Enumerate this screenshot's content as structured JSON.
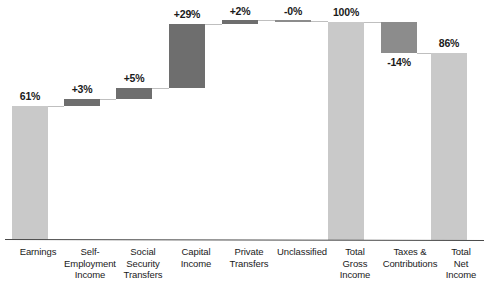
{
  "chart_data": {
    "type": "bar",
    "subtype": "waterfall",
    "title": "",
    "subtitle": "",
    "xlabel": "",
    "ylabel": "",
    "ylim": [
      0,
      100
    ],
    "grid": false,
    "legend": false,
    "unit": "percent",
    "categories": [
      "Earnings",
      "Self-Employment Income",
      "Social Security Transfers",
      "Capital Income",
      "Private Transfers",
      "Unclassified",
      "Total Gross Income",
      "Taxes & Contributions",
      "Total Net Income"
    ],
    "category_labels": [
      "Earnings",
      "Self-\nEmployment\nIncome",
      "Social\nSecurity\nTransfers",
      "Capital\nIncome",
      "Private\nTransfers",
      "Unclassified",
      "Total\nGross\nIncome",
      "Taxes &\nContributions",
      "Total\nNet\nIncome"
    ],
    "data_labels": [
      "61%",
      "+3%",
      "+5%",
      "+29%",
      "+2%",
      "-0%",
      "100%",
      "-14%",
      "86%"
    ],
    "values": [
      61,
      3,
      5,
      29,
      2,
      0,
      100,
      -14,
      86
    ],
    "bar_kinds": [
      "total",
      "delta",
      "delta",
      "delta",
      "delta",
      "delta",
      "total",
      "delta",
      "total"
    ],
    "cumulative_start": [
      0,
      61,
      64,
      69,
      98,
      100,
      0,
      100,
      0
    ],
    "cumulative_end": [
      61,
      64,
      69,
      98,
      100,
      100,
      100,
      86,
      86
    ],
    "colors": {
      "total_bar": "#c9c9c9",
      "delta_bar": "#6e6e6e",
      "delta_bar_mid": "#8c8c8c",
      "connector": "#bfbfbf",
      "axis": "#4a4a4a",
      "text": "#1a1a1a",
      "background": "#ffffff"
    },
    "bars": [
      {
        "label": "61%",
        "kind": "total",
        "color_key": "total_bar",
        "left": 12,
        "top": 106,
        "width": 36,
        "height": 134,
        "label_x": 12,
        "label_y": 90,
        "label_w": 36
      },
      {
        "label": "+3%",
        "kind": "delta",
        "color_key": "delta_bar",
        "left": 64,
        "top": 99,
        "width": 36,
        "height": 7,
        "label_x": 64,
        "label_y": 83,
        "label_w": 36
      },
      {
        "label": "+5%",
        "kind": "delta",
        "color_key": "delta_bar",
        "left": 116,
        "top": 88,
        "width": 36,
        "height": 11,
        "label_x": 116,
        "label_y": 72,
        "label_w": 36
      },
      {
        "label": "+29%",
        "kind": "delta",
        "color_key": "delta_bar",
        "left": 169,
        "top": 24,
        "width": 36,
        "height": 64,
        "label_x": 169,
        "label_y": 8,
        "label_w": 36
      },
      {
        "label": "+2%",
        "kind": "delta",
        "color_key": "delta_bar",
        "left": 222,
        "top": 20,
        "width": 36,
        "height": 4,
        "label_x": 222,
        "label_y": 5,
        "label_w": 36
      },
      {
        "label": "-0%",
        "kind": "delta",
        "color_key": "delta_bar_mid",
        "left": 275,
        "top": 20,
        "width": 36,
        "height": 2,
        "label_x": 275,
        "label_y": 5,
        "label_w": 36
      },
      {
        "label": "100%",
        "kind": "total",
        "color_key": "total_bar",
        "left": 328,
        "top": 22,
        "width": 36,
        "height": 218,
        "label_x": 328,
        "label_y": 6,
        "label_w": 36
      },
      {
        "label": "-14%",
        "kind": "delta",
        "color_key": "delta_bar_mid",
        "left": 381,
        "top": 22,
        "width": 36,
        "height": 31,
        "label_x": 381,
        "label_y": 56,
        "label_w": 36
      },
      {
        "label": "86%",
        "kind": "total",
        "color_key": "total_bar",
        "left": 431,
        "top": 53,
        "width": 36,
        "height": 187,
        "label_x": 431,
        "label_y": 37,
        "label_w": 36
      }
    ],
    "connectors": [
      {
        "left": 48,
        "top": 106,
        "width": 16
      },
      {
        "left": 100,
        "top": 99,
        "width": 16
      },
      {
        "left": 152,
        "top": 88,
        "width": 17
      },
      {
        "left": 205,
        "top": 24,
        "width": 17
      },
      {
        "left": 258,
        "top": 20,
        "width": 17
      },
      {
        "left": 311,
        "top": 21,
        "width": 17
      },
      {
        "left": 364,
        "top": 22,
        "width": 17
      },
      {
        "left": 417,
        "top": 53,
        "width": 14
      }
    ],
    "category_positions": [
      {
        "left": -6,
        "width": 88
      },
      {
        "left": 46,
        "width": 88
      },
      {
        "left": 99,
        "width": 88
      },
      {
        "left": 152,
        "width": 88
      },
      {
        "left": 205,
        "width": 88
      },
      {
        "left": 258,
        "width": 88
      },
      {
        "left": 311,
        "width": 88
      },
      {
        "left": 362,
        "width": 96
      },
      {
        "left": 417,
        "width": 88
      }
    ]
  }
}
